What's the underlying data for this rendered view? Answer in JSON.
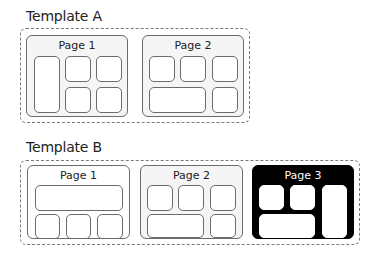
{
  "templates": [
    {
      "title": "Template A",
      "pages": [
        {
          "label": "Page 1"
        },
        {
          "label": "Page 2"
        }
      ]
    },
    {
      "title": "Template B",
      "pages": [
        {
          "label": "Page 1"
        },
        {
          "label": "Page 2"
        },
        {
          "label": "Page 3"
        }
      ]
    }
  ],
  "colors": {
    "page_fill": "#f5f5f5",
    "page_border": "#6b6b6b",
    "highlight_page_fill": "#000000",
    "slot_fill": "#ffffff"
  }
}
